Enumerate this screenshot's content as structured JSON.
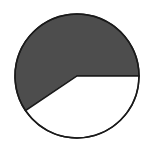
{
  "chart_data": {
    "type": "pie",
    "title": "",
    "categories": [
      "Shaded",
      "Unshaded"
    ],
    "values": [
      59.4,
      40.6
    ],
    "start_angle_deg": 0,
    "direction": "counterclockwise",
    "colors": [
      "#4d4d4d",
      "#ffffff"
    ],
    "outline_color": "#1a1a1a",
    "legend": "none",
    "labels": "none"
  },
  "geometry": {
    "cx": 77,
    "cy": 76,
    "r": 62
  }
}
